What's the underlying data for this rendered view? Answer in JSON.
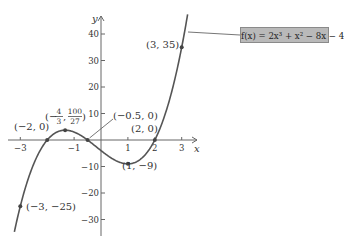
{
  "chart_data": {
    "type": "line",
    "title": "",
    "function_label": "f(x) = 2x³ + x² − 8x − 4",
    "coefficients": [
      2,
      1,
      -8,
      -4
    ],
    "xlabel": "x",
    "ylabel": "y",
    "xlim": [
      -3.3,
      3.6
    ],
    "ylim": [
      -36,
      46
    ],
    "x_ticks": [
      -3,
      -1,
      1,
      2,
      3
    ],
    "x_tick_labels": [
      "−3",
      "−1",
      "1",
      "2",
      "3"
    ],
    "y_ticks": [
      40,
      30,
      20,
      10,
      -10,
      -20,
      -30
    ],
    "y_tick_labels": [
      "40",
      "30",
      "20",
      "10",
      "−10",
      "−20",
      "−30"
    ],
    "grid": false,
    "legend": "top-right",
    "line_color": "#555555",
    "legend_bg": "#b9b9b9",
    "points": [
      {
        "x": -3,
        "y": -25,
        "label": "(−3, −25)"
      },
      {
        "x": -2,
        "y": 0,
        "label": "(−2, 0)"
      },
      {
        "x": -1.3333,
        "y": 3.7037,
        "label_main": "(−",
        "label_frac1_num": "4",
        "label_frac1_den": "3",
        "label_frac2_num": "100",
        "label_frac2_den": "27",
        "label": "(−4/3, 100/27)"
      },
      {
        "x": -0.5,
        "y": 0,
        "label": "(−0.5, 0)"
      },
      {
        "x": 1,
        "y": -9,
        "label": "(1, −9)"
      },
      {
        "x": 2,
        "y": 0,
        "label": "(2, 0)"
      },
      {
        "x": 3,
        "y": 35,
        "label": "(3, 35)"
      }
    ]
  }
}
